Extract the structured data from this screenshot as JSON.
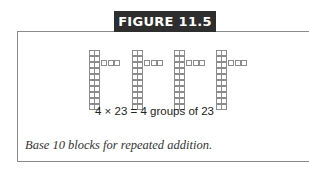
{
  "figure": {
    "label": "FIGURE 11.5",
    "equation": "4 × 23 = 4 groups of 23",
    "caption": "Base 10 blocks for repeated addition.",
    "colors": {
      "label_bg": "#2e2e2e",
      "label_text": "#ffffff",
      "border": "#8a8a8a",
      "block_outline": "#8c8c8c"
    }
  },
  "diagram": {
    "groups": [
      {
        "tens": 2,
        "ones": 3,
        "x": 89
      },
      {
        "tens": 2,
        "ones": 3,
        "x": 132
      },
      {
        "tens": 2,
        "ones": 3,
        "x": 174
      },
      {
        "tens": 2,
        "ones": 3,
        "x": 216
      }
    ],
    "cells_per_rod": 10
  }
}
